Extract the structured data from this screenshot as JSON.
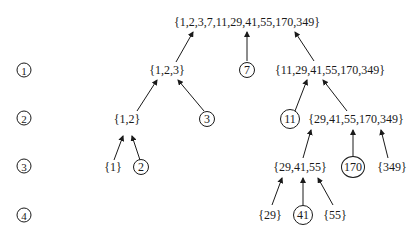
{
  "levels": [
    "1",
    "2",
    "3",
    "4"
  ],
  "nodes": {
    "root": "{1,2,3,7,11,29,41,55,170,349}",
    "n_123": "{1,2,3}",
    "n_7": "7",
    "n_11_349": "{11,29,41,55,170,349}",
    "n_12": "{1,2}",
    "n_3": "3",
    "n_11": "11",
    "n_29_349": "{29,41,55,170,349}",
    "n_1": "{1}",
    "n_2": "2",
    "n_29_55": "{29,41,55}",
    "n_170": "170",
    "n_349": "{349}",
    "n_29": "{29}",
    "n_41": "41",
    "n_55": "{55}"
  }
}
